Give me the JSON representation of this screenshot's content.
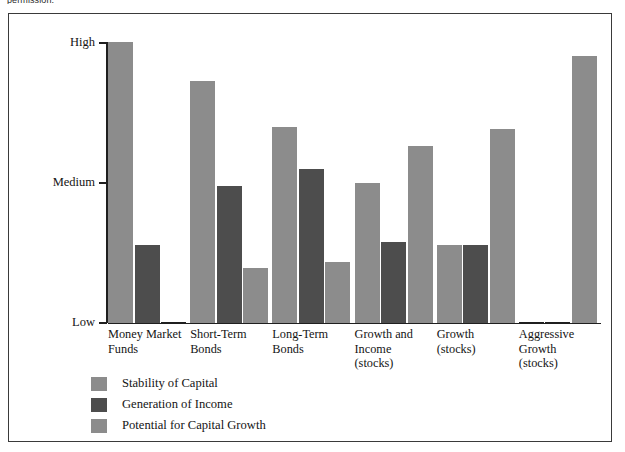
{
  "page_fragment": "permission.",
  "chart_data": {
    "type": "bar",
    "title": "",
    "subtitle": "",
    "xlabel": "",
    "ylabel": "",
    "grid": false,
    "legend_position": "bottom-left",
    "orientation": "vertical-grouped",
    "y_axis": {
      "tick_labels": [
        "High",
        "Medium",
        "Low"
      ],
      "ticks": [
        100,
        50,
        0
      ],
      "ylim": [
        0,
        100
      ],
      "scale": "ordinal"
    },
    "categories": [
      "Money Market Funds",
      "Short-Term Bonds",
      "Long-Term Bonds",
      "Growth and Income (stocks)",
      "Growth (stocks)",
      "Aggressive Growth (stocks)"
    ],
    "series": [
      {
        "name": "Stability of Capital",
        "color": "#8c8c8c",
        "values": [
          100,
          86,
          70,
          50,
          28,
          0
        ]
      },
      {
        "name": "Generation of Income",
        "color": "#4d4d4d",
        "values": [
          28,
          49,
          55,
          29,
          28,
          0
        ]
      },
      {
        "name": "Potential for Capital Growth",
        "color": "#8c8c8c",
        "values": [
          0,
          20,
          22,
          63,
          69,
          95
        ]
      }
    ]
  },
  "axis": {
    "high_label": "High",
    "medium_label": "Medium",
    "low_label": "Low"
  },
  "legend": {
    "items": [
      {
        "label": "Stability of Capital",
        "color": "#8c8c8c"
      },
      {
        "label": "Generation of Income",
        "color": "#4d4d4d"
      },
      {
        "label": "Potential for Capital Growth",
        "color": "#8c8c8c"
      }
    ]
  },
  "colors": {
    "series1": "#8c8c8c",
    "series2": "#4d4d4d",
    "series3": "#8c8c8c",
    "axis": "#1f1f1f",
    "frame": "#3a3a3a",
    "text": "#141414",
    "background": "#ffffff"
  }
}
